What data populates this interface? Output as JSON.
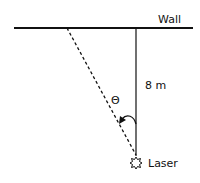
{
  "diagram": {
    "wall_label": "Wall",
    "distance_label": "8 m",
    "angle_label": "Θ",
    "source_label": "Laser",
    "icons": {
      "laser": "laser-burst-icon",
      "angle_arrow": "angle-arc-arrow-icon"
    },
    "colors": {
      "line": "#111111",
      "background": "#ffffff"
    }
  }
}
